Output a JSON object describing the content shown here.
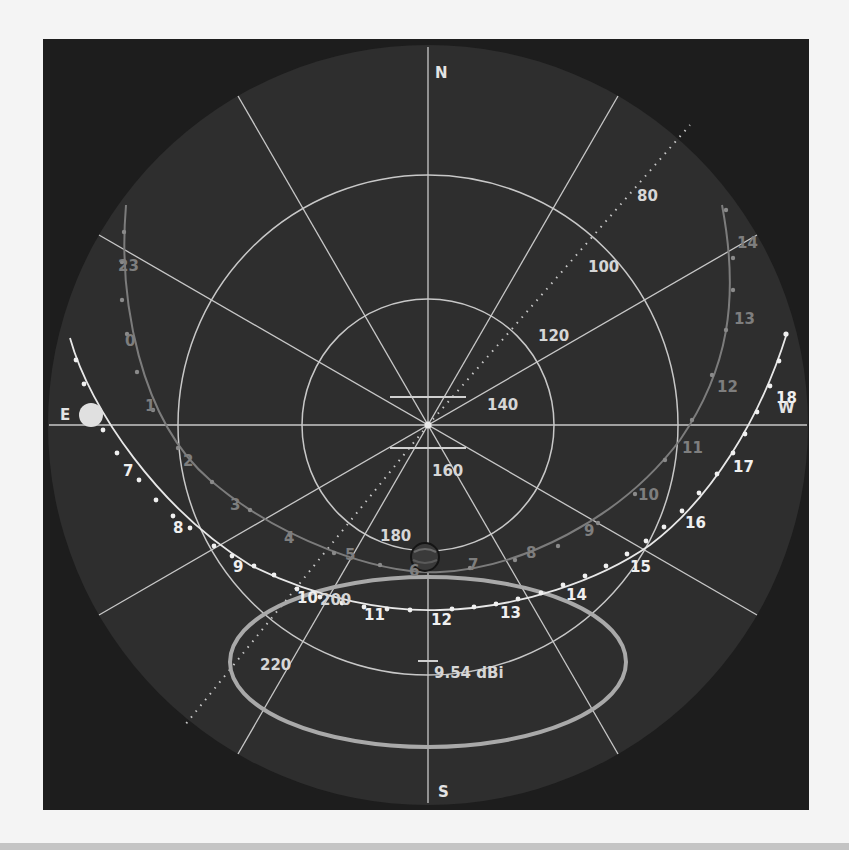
{
  "view": {
    "title": "Sky polar plot",
    "colors": {
      "page_bg": "#f4f4f4",
      "panel_bg": "#1d1d1d",
      "sky_disc": "#2e2e2e",
      "grid": "#c8c8c8",
      "track_today": "#e8e8e8",
      "track_other": "#7c7c7c",
      "ellipse": "#a9a9a9",
      "sun": "#e0e0e0",
      "planet": "#3a3a3a"
    }
  },
  "compass": {
    "north": "N",
    "south": "S",
    "east": "E",
    "west": "W"
  },
  "azimuth_scale_labels": [
    {
      "text": "80",
      "x": 637,
      "y": 201
    },
    {
      "text": "100",
      "x": 588,
      "y": 272
    },
    {
      "text": "120",
      "x": 538,
      "y": 341
    },
    {
      "text": "140",
      "x": 487,
      "y": 410
    },
    {
      "text": "160",
      "x": 432,
      "y": 476
    },
    {
      "text": "180",
      "x": 380,
      "y": 541
    },
    {
      "text": "200",
      "x": 320,
      "y": 605
    },
    {
      "text": "220",
      "x": 260,
      "y": 670
    }
  ],
  "sun_track": {
    "label": "Sun path (today)",
    "hour_labels": [
      {
        "text": "7",
        "x": 123,
        "y": 476
      },
      {
        "text": "8",
        "x": 173,
        "y": 533
      },
      {
        "text": "9",
        "x": 233,
        "y": 572
      },
      {
        "text": "10",
        "x": 297,
        "y": 603
      },
      {
        "text": "11",
        "x": 364,
        "y": 620
      },
      {
        "text": "12",
        "x": 431,
        "y": 625
      },
      {
        "text": "13",
        "x": 500,
        "y": 618
      },
      {
        "text": "14",
        "x": 566,
        "y": 600
      },
      {
        "text": "15",
        "x": 630,
        "y": 572
      },
      {
        "text": "16",
        "x": 685,
        "y": 528
      },
      {
        "text": "17",
        "x": 733,
        "y": 472
      },
      {
        "text": "18",
        "x": 776,
        "y": 403
      }
    ]
  },
  "moon_track": {
    "label": "Planet path",
    "hour_labels": [
      {
        "text": "23",
        "x": 118,
        "y": 271
      },
      {
        "text": "0",
        "x": 125,
        "y": 346
      },
      {
        "text": "1",
        "x": 145,
        "y": 411
      },
      {
        "text": "2",
        "x": 183,
        "y": 466
      },
      {
        "text": "3",
        "x": 230,
        "y": 510
      },
      {
        "text": "4",
        "x": 284,
        "y": 543
      },
      {
        "text": "5",
        "x": 345,
        "y": 560
      },
      {
        "text": "6",
        "x": 409,
        "y": 576
      },
      {
        "text": "7",
        "x": 468,
        "y": 570
      },
      {
        "text": "8",
        "x": 526,
        "y": 558
      },
      {
        "text": "9",
        "x": 584,
        "y": 536
      },
      {
        "text": "10",
        "x": 638,
        "y": 500
      },
      {
        "text": "11",
        "x": 682,
        "y": 453
      },
      {
        "text": "12",
        "x": 717,
        "y": 392
      },
      {
        "text": "13",
        "x": 734,
        "y": 324
      },
      {
        "text": "14",
        "x": 737,
        "y": 248
      }
    ]
  },
  "gain_marker": {
    "label": "9.54 dBi"
  }
}
